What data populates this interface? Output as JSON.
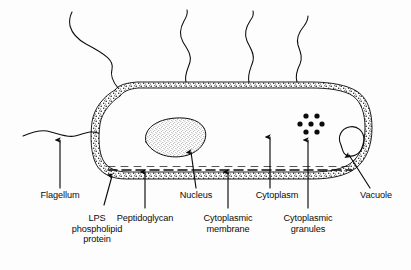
{
  "figure": {
    "kind": "line-drawing",
    "background_color": "#fdfdfd",
    "ink_color": "#0b0b0b"
  },
  "labels": [
    {
      "id": "flagellum",
      "text": "Flagellum",
      "x": 60,
      "y": 196
    },
    {
      "id": "lps",
      "text": "LPS\nphospholipid\nprotein",
      "x": 97,
      "y": 219
    },
    {
      "id": "peptidoglycan",
      "text": "Peptidoglycan",
      "x": 145,
      "y": 219
    },
    {
      "id": "nucleus",
      "text": "Nucleus",
      "x": 196,
      "y": 196
    },
    {
      "id": "cytoplasmic-membrane",
      "text": "Cytoplasmic\nmembrane",
      "x": 228,
      "y": 219
    },
    {
      "id": "cytoplasm",
      "text": "Cytoplasm",
      "x": 277,
      "y": 196
    },
    {
      "id": "cytoplasmic-granules",
      "text": "Cytoplasmic\ngranules",
      "x": 308,
      "y": 219
    },
    {
      "id": "vacuole",
      "text": "Vacuole",
      "x": 376,
      "y": 196
    }
  ],
  "structures": {
    "cell_envelope": "stippled outer wall band",
    "peptidoglycan_layer": "dashed inner line",
    "nucleus": "stippled ellipse",
    "vacuole": "open rounded outline",
    "granule_count": 7,
    "flagella_count": 4
  }
}
